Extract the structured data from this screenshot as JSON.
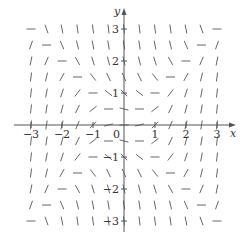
{
  "figure": {
    "type": "slope-field",
    "equation_implied": "dy/dx = x^2 - y^2",
    "x_axis_label": "x",
    "y_axis_label": "y",
    "x_ticks": [
      {
        "value": -3,
        "label": "−3"
      },
      {
        "value": -2,
        "label": "−2"
      },
      {
        "value": -1,
        "label": "−1"
      },
      {
        "value": 1,
        "label": "1"
      },
      {
        "value": 2,
        "label": "2"
      },
      {
        "value": 3,
        "label": "3"
      }
    ],
    "y_ticks": [
      {
        "value": 3,
        "label": "3"
      },
      {
        "value": 2,
        "label": "2"
      },
      {
        "value": 1,
        "label": "1"
      },
      {
        "value": -1,
        "label": "−1"
      },
      {
        "value": -2,
        "label": "−2"
      },
      {
        "value": -3,
        "label": "−3"
      }
    ],
    "origin_label": "0",
    "x_range": [
      -3,
      3
    ],
    "y_range": [
      -3,
      3
    ],
    "grid_step": 0.5,
    "segment_length_px": 9,
    "colors": {
      "axis": "#555555",
      "segment": "#666666",
      "text": "#333333",
      "background": "#ffffff"
    }
  }
}
